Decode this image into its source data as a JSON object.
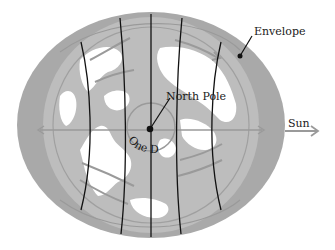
{
  "diagram": {
    "title": "",
    "labels": {
      "envelope": "Envelope",
      "north_pole": "North Pole",
      "one_day": "One Day",
      "sun": "Sun"
    },
    "colors": {
      "background": "#ffffff",
      "envelope": "#a9a9a9",
      "ocean": "#bdbdbd",
      "land": "#ffffff",
      "meridian": "#111111",
      "arrows": "#9a9a9a",
      "text": "#1a1a1a"
    },
    "elements": [
      {
        "id": "envelope",
        "shape": "ellipse",
        "description": "Elongated tidal envelope around Earth, stretched along the Earth-Sun axis"
      },
      {
        "id": "earth",
        "shape": "circle",
        "description": "Earth viewed from above the North Pole"
      },
      {
        "id": "meridians",
        "count": 5,
        "description": "Longitude lines drawn across the globe"
      },
      {
        "id": "north-pole-marker",
        "shape": "dot"
      },
      {
        "id": "rotation-circle",
        "description": "Circle around pole labeled One Day"
      },
      {
        "id": "sun-arrow",
        "direction": "right"
      }
    ]
  }
}
